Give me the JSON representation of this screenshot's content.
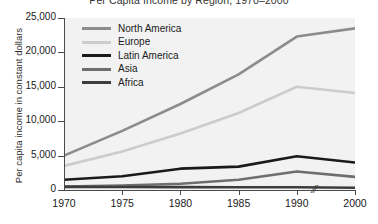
{
  "chart_data": {
    "type": "line",
    "title": "Per Capita Income by Region, 1970–2000",
    "xlabel": "",
    "ylabel": "Per capita income in constant dollars",
    "x": [
      1970,
      1975,
      1980,
      1985,
      1990,
      2000
    ],
    "xtick_labels": [
      "1970",
      "1975",
      "1980",
      "1985",
      "1990",
      "2000"
    ],
    "ytick_labels": [
      "0",
      "5,000",
      "10,000",
      "15,000",
      "20,000",
      "25,000"
    ],
    "ytick_values": [
      0,
      5000,
      10000,
      15000,
      20000,
      25000
    ],
    "ylim": [
      0,
      25000
    ],
    "xlim": [
      1970,
      2000
    ],
    "grid": false,
    "axis_break": {
      "between": [
        1990,
        2000
      ],
      "symbol": "//"
    },
    "legend_position": "upper-left-inside",
    "series": [
      {
        "name": "North America",
        "color": "#8c8c8c",
        "values": [
          5000,
          8600,
          12500,
          16800,
          22300,
          23500
        ]
      },
      {
        "name": "Europe",
        "color": "#cccccc",
        "values": [
          3500,
          5600,
          8200,
          11200,
          15000,
          14100
        ]
      },
      {
        "name": "Latin America",
        "color": "#1a1a1a",
        "values": [
          1500,
          2000,
          3100,
          3400,
          4900,
          4000
        ]
      },
      {
        "name": "Asia",
        "color": "#6e6e6e",
        "values": [
          500,
          650,
          900,
          1500,
          2700,
          1900
        ]
      },
      {
        "name": "Africa",
        "color": "#3d3d3d",
        "values": [
          450,
          430,
          420,
          400,
          390,
          330
        ]
      }
    ]
  }
}
